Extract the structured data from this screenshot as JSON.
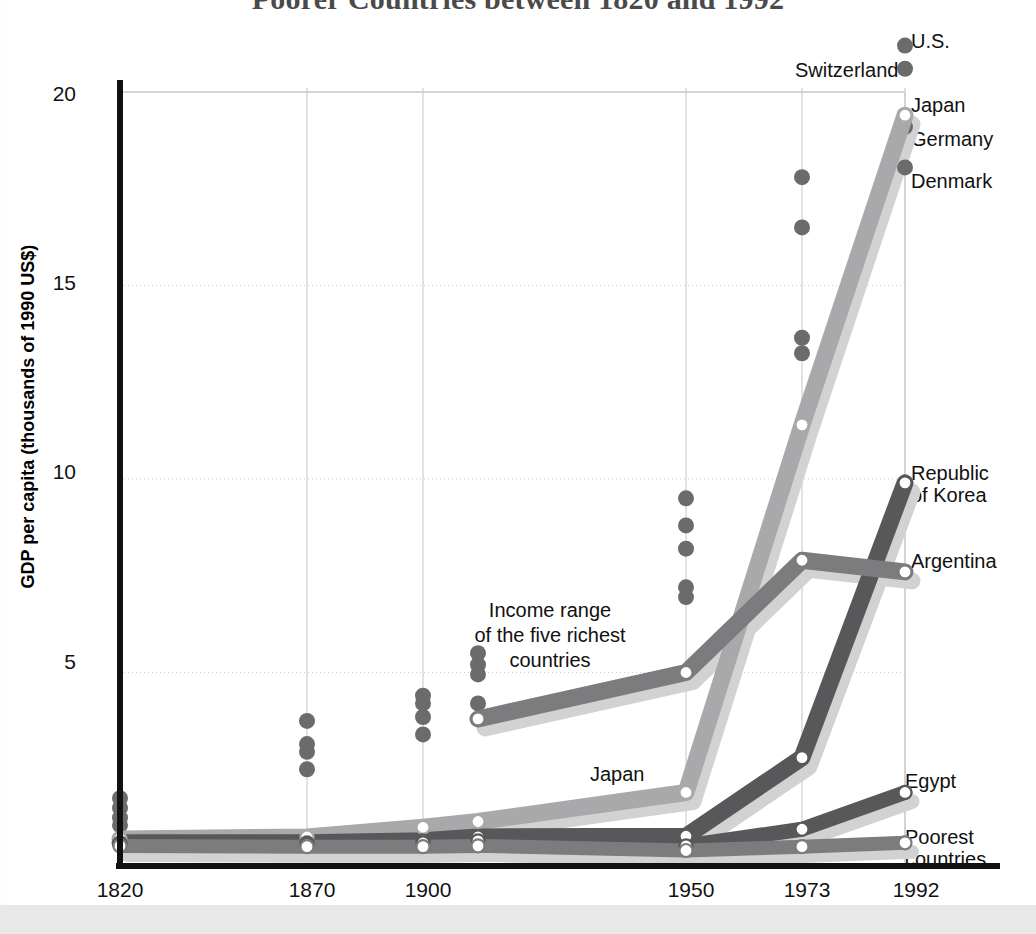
{
  "title": "Poorer Countries between 1820 and 1992",
  "axes": {
    "ylabel": "GDP per capita (thousands of 1990 US$)",
    "yticks": [
      "20",
      "15",
      "10",
      "5"
    ],
    "xticks": [
      "1820",
      "1870",
      "1900",
      "1950",
      "1973",
      "1992"
    ]
  },
  "annotations": [
    {
      "name": "income-range-note",
      "lines": [
        "Income range",
        "of the five richest",
        "countries"
      ]
    },
    {
      "name": "japan-inline-label",
      "lines": [
        "Japan"
      ]
    }
  ],
  "series_labels": [
    {
      "name": "us",
      "lines": [
        "U.S."
      ]
    },
    {
      "name": "switzerland",
      "lines": [
        "Switzerland"
      ]
    },
    {
      "name": "japan",
      "lines": [
        "Japan"
      ]
    },
    {
      "name": "germany",
      "lines": [
        "Germany"
      ]
    },
    {
      "name": "denmark",
      "lines": [
        "Denmark"
      ]
    },
    {
      "name": "republic-of-korea",
      "lines": [
        "Republic",
        "of Korea"
      ]
    },
    {
      "name": "argentina",
      "lines": [
        "Argentina"
      ]
    },
    {
      "name": "egypt",
      "lines": [
        "Egypt"
      ]
    },
    {
      "name": "poorest-countries",
      "lines": [
        "Poorest",
        "countries"
      ]
    }
  ],
  "colors": {
    "line_dark": "#58585a",
    "line_mid": "#7c7c7e",
    "line_light": "#a9a9ab",
    "shadow": "#d2d2d2",
    "marker_fill": "#ffffff",
    "dot": "#6b6b6d",
    "grid": "#cfcfcf",
    "axis": "#111111",
    "title": "#4a4a4a"
  },
  "chart_data": {
    "type": "line",
    "title": "Poorer Countries between 1820 and 1992",
    "xlabel": "",
    "ylabel": "GDP per capita (thousands of 1990 US$)",
    "x": [
      1820,
      1870,
      1900,
      1913,
      1950,
      1973,
      1992
    ],
    "xlim": [
      1815,
      1996
    ],
    "ylim": [
      0,
      21.2
    ],
    "yticks": [
      5,
      10,
      15,
      20
    ],
    "grid": true,
    "legend": "right-side series labels",
    "series": [
      {
        "name": "Japan",
        "x": [
          1820,
          1870,
          1900,
          1913,
          1950,
          1973,
          1992
        ],
        "values": [
          0.7,
          0.75,
          1.0,
          1.15,
          1.9,
          11.4,
          19.4
        ]
      },
      {
        "name": "Republic of Korea",
        "x": [
          1820,
          1870,
          1900,
          1913,
          1950,
          1973,
          1992
        ],
        "values": [
          0.6,
          0.6,
          0.65,
          0.75,
          0.77,
          2.8,
          9.9
        ]
      },
      {
        "name": "Argentina",
        "x": [
          1913,
          1950,
          1973,
          1992
        ],
        "values": [
          3.8,
          5.0,
          7.9,
          7.6
        ]
      },
      {
        "name": "Egypt",
        "x": [
          1820,
          1870,
          1900,
          1913,
          1950,
          1973,
          1992
        ],
        "values": [
          0.55,
          0.55,
          0.6,
          0.65,
          0.52,
          0.95,
          1.9
        ]
      },
      {
        "name": "Poorest countries",
        "x": [
          1820,
          1870,
          1900,
          1913,
          1950,
          1973,
          1992
        ],
        "values": [
          0.52,
          0.5,
          0.5,
          0.52,
          0.4,
          0.5,
          0.6
        ]
      }
    ],
    "richest_country_dots": [
      {
        "year": 1820,
        "values": [
          1.75,
          1.5,
          1.25,
          1.05
        ]
      },
      {
        "year": 1870,
        "values": [
          3.75,
          3.15,
          2.95,
          2.5
        ]
      },
      {
        "year": 1900,
        "values": [
          4.4,
          4.2,
          3.85,
          3.4
        ]
      },
      {
        "year": 1913,
        "values": [
          5.5,
          5.2,
          4.95,
          4.2
        ]
      },
      {
        "year": 1950,
        "values": [
          9.5,
          8.8,
          8.2,
          7.2,
          6.95
        ]
      },
      {
        "year": 1973,
        "values": [
          17.8,
          16.5,
          13.65,
          13.25
        ]
      },
      {
        "year": 1992,
        "values": [
          21.2,
          20.6,
          19.1,
          18.05
        ]
      }
    ]
  }
}
